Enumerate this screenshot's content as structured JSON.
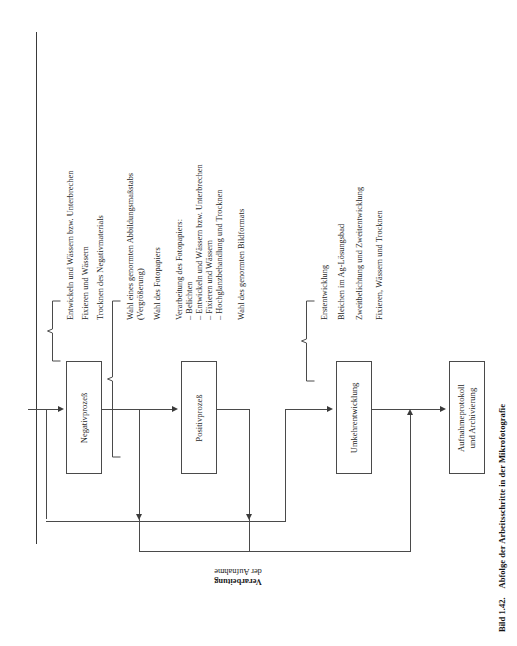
{
  "figure": {
    "caption_number": "Bild 1.42.",
    "caption_text": "Abfolge der Arbeitsschritte in der Mikrofotografie",
    "side_label_line1": "Verarbeitung",
    "side_label_line2": "der Aufnahme"
  },
  "boxes": [
    {
      "id": "negativprozess",
      "label": "Negativprozeß"
    },
    {
      "id": "positivprozess",
      "label": "Positivprozeß"
    },
    {
      "id": "umkehrentwicklung",
      "label": "Umkehrentwicklung"
    },
    {
      "id": "aufnahmeprotokoll",
      "label_line1": "Aufnahmeprotokoll",
      "label_line2": "und Archivierung"
    }
  ],
  "groups": [
    {
      "id": "negativ-steps",
      "items": [
        "Entwickeln und Wässern bzw. Unterbrechen",
        "Fixieren und Wässern",
        "Trocknen des Negativmaterials"
      ]
    },
    {
      "id": "positiv-steps",
      "items": [
        "Wahl eines genormten Abbildungsmaßstabs",
        "(Vergrößerung)",
        "Wahl des Fotopapiers",
        "Verarbeitung des Fotopapiers:",
        "– Belichten",
        "– Entwickeln und Wässern bzw. Unterbrechen",
        "– Fixieren und Wässern",
        "– Hochglanzbehandlung und Trocknen",
        "Wahl des genormten Bildformats"
      ]
    },
    {
      "id": "umkehr-steps",
      "items": [
        "Erstentwicklung",
        "Bleichen im Ag-Lösungsbad",
        "Zweitbelichtung und Zweitentwicklung",
        "Fixieren, Wässern und Trocknen"
      ]
    }
  ],
  "colors": {
    "ink": "#1a1a1a",
    "line": "#4a4a4a",
    "paper": "#ffffff"
  }
}
